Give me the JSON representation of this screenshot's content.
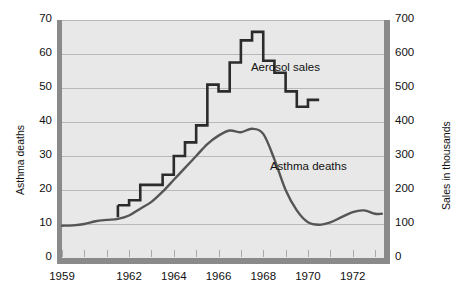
{
  "chart_data": {
    "type": "line",
    "title": "",
    "xlabel": "",
    "ylabel": "Asthma deaths",
    "ylabel_right": "Sales in thousands",
    "xlim": [
      1959,
      1973.4
    ],
    "ylim": [
      0,
      70
    ],
    "ylim_right": [
      0,
      700
    ],
    "grid": true,
    "legend_position": "inline-annotations",
    "x_ticks": [
      1959,
      1960,
      1961,
      1962,
      1963,
      1964,
      1965,
      1966,
      1967,
      1968,
      1969,
      1970,
      1971,
      1972,
      1973
    ],
    "x_tick_labels": [
      "1959",
      "",
      "",
      "1962",
      "",
      "1964",
      "",
      "1966",
      "",
      "1968",
      "",
      "1970",
      "",
      "1972",
      ""
    ],
    "y_ticks_left": [
      0,
      10,
      20,
      30,
      40,
      50,
      60,
      70
    ],
    "y_tick_labels_left": [
      "0",
      "10",
      "20",
      "30",
      "40",
      "50",
      "60",
      "70"
    ],
    "y_ticks_right": [
      0,
      100,
      200,
      300,
      400,
      500,
      600,
      700
    ],
    "y_tick_labels_right": [
      "0",
      "100",
      "200",
      "300",
      "400",
      "500",
      "600",
      "700"
    ],
    "annotations": [
      {
        "text": "Aerosol sales",
        "x": 1967.45,
        "y": 55.5
      },
      {
        "text": "Asthma deaths",
        "x": 1968.3,
        "y": 26.5
      }
    ],
    "series": [
      {
        "name": "Aerosol sales",
        "axis": "right",
        "style": "step",
        "unit": "thousands",
        "color": "#2b2b2b",
        "x": [
          1961.5,
          1962.0,
          1962.5,
          1963.0,
          1963.5,
          1964.0,
          1964.5,
          1965.0,
          1965.5,
          1966.0,
          1966.5,
          1967.0,
          1967.5,
          1968.0,
          1968.5,
          1969.0,
          1969.5,
          1970.0
        ],
        "values": [
          155,
          170,
          215,
          215,
          245,
          300,
          340,
          390,
          510,
          490,
          575,
          640,
          665,
          580,
          545,
          490,
          445,
          465
        ]
      },
      {
        "name": "Asthma deaths",
        "axis": "left",
        "style": "smooth",
        "unit": "deaths",
        "color": "#555555",
        "x": [
          1959.0,
          1959.5,
          1960.0,
          1960.5,
          1961.0,
          1961.5,
          1962.0,
          1962.5,
          1963.0,
          1963.5,
          1964.0,
          1964.5,
          1965.0,
          1965.5,
          1966.0,
          1966.5,
          1967.0,
          1967.5,
          1968.0,
          1968.5,
          1969.0,
          1969.5,
          1970.0,
          1970.5,
          1971.0,
          1971.5,
          1972.0,
          1972.5,
          1973.0,
          1973.3
        ],
        "values": [
          9.5,
          9.6,
          10.0,
          10.8,
          11.2,
          11.5,
          12.5,
          14.5,
          16.5,
          19.5,
          23.0,
          26.5,
          30.0,
          33.5,
          36.0,
          37.5,
          37.0,
          38.0,
          36.5,
          29.0,
          20.0,
          14.0,
          10.5,
          9.8,
          10.5,
          12.0,
          13.5,
          14.0,
          13.0,
          13.0
        ]
      }
    ]
  },
  "colors": {
    "plot_background": "#e8e8e8",
    "axis_bar": "#8a8a8a",
    "gridline": "#b8b8b8",
    "aerosol_line": "#2b2b2b",
    "asthma_line": "#555555",
    "text": "#111111"
  }
}
